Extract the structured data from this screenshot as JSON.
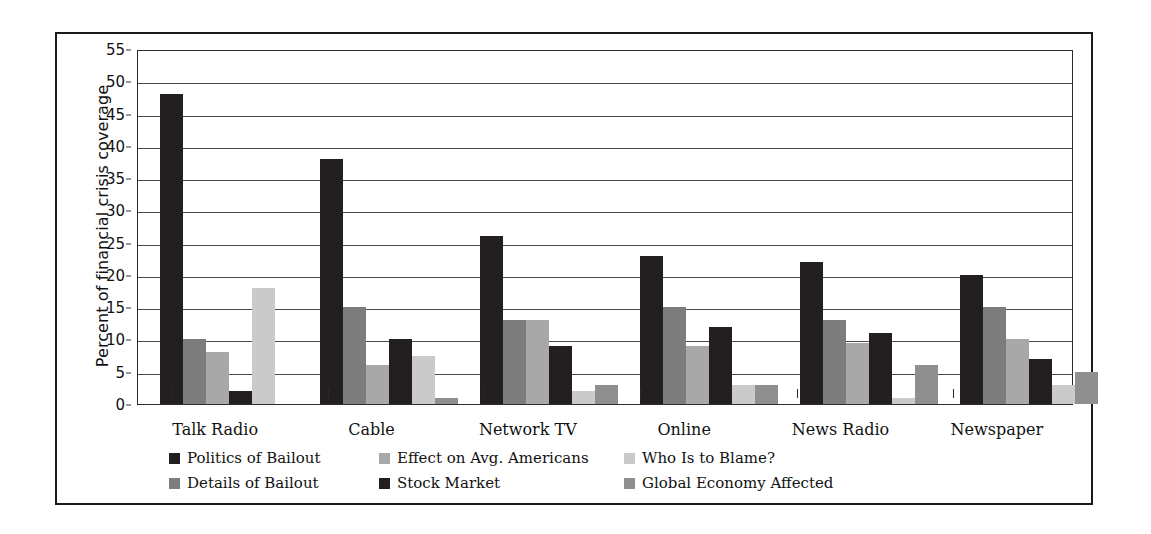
{
  "chart_data": {
    "type": "bar",
    "title": "",
    "subtitle": "",
    "xlabel": "",
    "ylabel": "Percent of financial crisis coverage",
    "ylim": [
      0,
      55
    ],
    "ytick_step": 5,
    "yticks": [
      55,
      50,
      45,
      40,
      35,
      30,
      25,
      20,
      15,
      10,
      5,
      0
    ],
    "grid": "horizontal",
    "legend_position": "bottom",
    "categories": [
      "Talk Radio",
      "Cable",
      "Network TV",
      "Online",
      "News Radio",
      "Newspaper"
    ],
    "series": [
      {
        "name": "Politics of Bailout",
        "color": "#231f20",
        "values": [
          48,
          38,
          26,
          23,
          22,
          20
        ]
      },
      {
        "name": "Details of Bailout",
        "color": "#7d7d7d",
        "values": [
          10,
          15,
          13,
          15,
          13,
          15
        ]
      },
      {
        "name": "Effect on Avg. Americans",
        "color": "#a8a8a8",
        "values": [
          8,
          6,
          13,
          9,
          9.5,
          10
        ]
      },
      {
        "name": "Stock Market",
        "color": "#231f20",
        "values": [
          2,
          10,
          9,
          12,
          11,
          7
        ]
      },
      {
        "name": "Who Is to Blame?",
        "color": "#cacaca",
        "values": [
          18,
          7.5,
          2,
          3,
          1,
          3
        ]
      },
      {
        "name": "Global Economy Affected",
        "color": "#8f8f8f",
        "values": [
          0,
          1,
          3,
          3,
          6,
          5
        ]
      }
    ]
  },
  "legend": {
    "rows": [
      [
        {
          "label": "Politics of Bailout",
          "color": "#231f20"
        },
        {
          "label": "Effect on Avg. Americans",
          "color": "#a8a8a8"
        },
        {
          "label": "Who Is to Blame?",
          "color": "#cacaca"
        }
      ],
      [
        {
          "label": "Details of Bailout",
          "color": "#7d7d7d"
        },
        {
          "label": "Stock Market",
          "color": "#231f20"
        },
        {
          "label": "Global Economy Affected",
          "color": "#8f8f8f"
        }
      ]
    ]
  }
}
